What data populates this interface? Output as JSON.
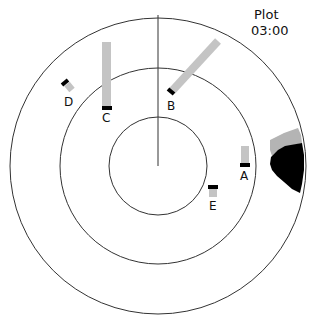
{
  "title": {
    "line1": "Plot",
    "line2": "03:00"
  },
  "colors": {
    "ring": "#333333",
    "trail": "#c4c4c4",
    "target": "#000000",
    "land_far": "#b4b4b4",
    "land_near": "#000000"
  },
  "radar": {
    "center": [
      158,
      166
    ],
    "rings": [
      49,
      98,
      148
    ],
    "heading_line": {
      "from": [
        158,
        166
      ],
      "to": [
        158,
        15
      ]
    }
  },
  "targets": [
    {
      "id": "A",
      "label": "A"
    },
    {
      "id": "B",
      "label": "B"
    },
    {
      "id": "C",
      "label": "C"
    },
    {
      "id": "D",
      "label": "D"
    },
    {
      "id": "E",
      "label": "E"
    }
  ]
}
